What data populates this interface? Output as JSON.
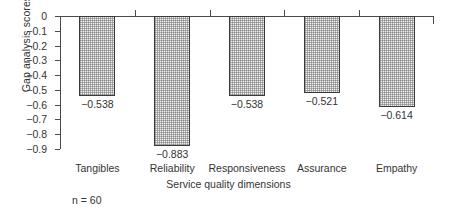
{
  "chart_data": {
    "type": "bar",
    "title": "",
    "xlabel": "Service quality dimensions",
    "ylabel": "Gap analysis scores",
    "categories": [
      "Tangibles",
      "Reliability",
      "Responsiveness",
      "Assurance",
      "Empathy"
    ],
    "values": [
      -0.538,
      -0.883,
      -0.538,
      -0.521,
      -0.614
    ],
    "value_labels": [
      "−0.538",
      "−0.883",
      "−0.538",
      "−0.521",
      "−0.614"
    ],
    "ylim": [
      -0.9,
      0
    ],
    "ytick_labels": [
      "0",
      "−0.1",
      "−0.2",
      "−0.3",
      "−0.4",
      "−0.5",
      "−0.6",
      "−0.7",
      "−0.8",
      "−0.9"
    ],
    "ytick_values": [
      0,
      -0.1,
      -0.2,
      -0.3,
      -0.4,
      -0.5,
      -0.6,
      -0.7,
      -0.8,
      -0.9
    ],
    "grid": false,
    "legend": null,
    "annotation": "n = 60",
    "orientation": "downward-bars-from-zero",
    "bar_fill_color": "#efefef",
    "bar_edge_color": "#3a3a3a",
    "axis_color": "#4a4a4a"
  }
}
